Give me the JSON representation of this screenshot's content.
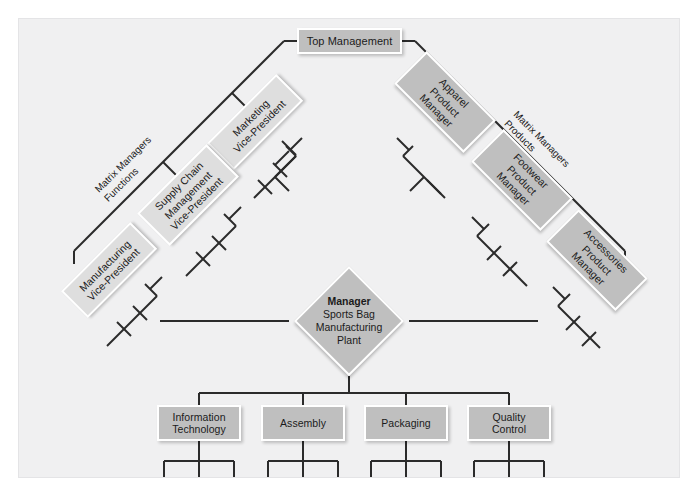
{
  "diagram": {
    "type": "org-chart-matrix",
    "background_color": "#f0f0f1",
    "node_fill_color": "#bfbfbf",
    "node_border_color": "#ffffff",
    "line_color": "#2b2b2b",
    "text_color": "#1b1b1b"
  },
  "top": {
    "label": "Top Management"
  },
  "axis_labels": {
    "left_line1": "Matrix Managers",
    "left_line2": "Functions",
    "right_line1": "Matrix Managers",
    "right_line2": "Products"
  },
  "functions_managers": [
    {
      "label": "Marketing\nVice-President"
    },
    {
      "label": "Supply Chain\nManagement\nVice-President"
    },
    {
      "label": "Manufacturing\nVice-President"
    }
  ],
  "products_managers": [
    {
      "label": "Apparel\nProduct\nManager"
    },
    {
      "label": "Footwear\nProduct\nManager"
    },
    {
      "label": "Accessories\nProduct\nManager"
    }
  ],
  "center": {
    "title": "Manager",
    "line2": "Sports Bag",
    "line3": "Manufacturing",
    "line4": "Plant"
  },
  "departments": [
    {
      "label": "Information\nTechnology"
    },
    {
      "label": "Assembly"
    },
    {
      "label": "Packaging"
    },
    {
      "label": "Quality\nControl"
    }
  ]
}
